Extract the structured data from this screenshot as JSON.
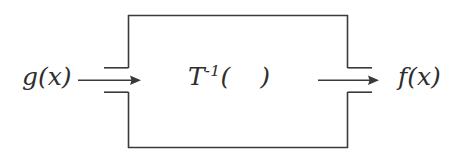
{
  "diagram": {
    "type": "block-diagram",
    "background_color": "#ffffff",
    "line_color": "#3a3a3a",
    "text_color": "#2e2e2e",
    "input": {
      "label": "g(x)",
      "position": "left"
    },
    "output": {
      "label": "f(x)",
      "position": "right"
    },
    "block": {
      "operator": "T",
      "exponent": "-1",
      "open_paren": "(",
      "argument": "",
      "close_paren": ")",
      "full_label": "T-1(   )"
    },
    "arrows": [
      {
        "name": "input-arrow",
        "direction": "right",
        "from_x": 78,
        "to_x": 140,
        "y": 80
      },
      {
        "name": "output-arrow",
        "direction": "right",
        "from_x": 318,
        "to_x": 378,
        "y": 80
      }
    ],
    "box": {
      "left": 128,
      "top": 15,
      "right": 348,
      "bottom": 148,
      "gap_top": 68,
      "gap_bottom": 92,
      "stub_length": 24
    }
  }
}
